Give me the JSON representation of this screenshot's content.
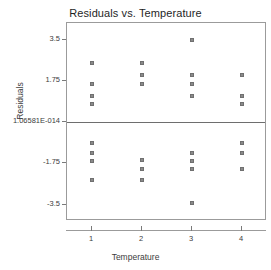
{
  "chart_data": {
    "type": "scatter",
    "title": "Residuals vs. Temperature",
    "xlabel": "Temperature",
    "ylabel": "Residuals",
    "grid": false,
    "legend": null,
    "reference_line": {
      "y": 0,
      "label": "zero-residual-line"
    },
    "xlim": [
      0.5,
      4.5
    ],
    "ylim": [
      -4.2,
      4.2
    ],
    "xticks": [
      1,
      2,
      3,
      4
    ],
    "xtick_labels": [
      "1",
      "2",
      "3",
      "4"
    ],
    "yticks": [
      3.5,
      1.75,
      0,
      -1.75,
      -3.5
    ],
    "ytick_labels": [
      "3.5",
      "1.75",
      "1.06581E-014",
      "-1.75",
      "-3.5"
    ],
    "x": [
      1,
      1,
      1,
      1,
      1,
      1,
      1,
      1,
      2,
      2,
      2,
      2,
      2,
      2,
      3,
      3,
      3,
      3,
      3,
      3,
      3,
      3,
      4,
      4,
      4,
      4,
      4,
      4
    ],
    "y": [
      2.5,
      1.6,
      1.1,
      0.75,
      -0.9,
      -1.3,
      -1.65,
      -2.45,
      2.5,
      2.0,
      1.6,
      -1.6,
      -2.0,
      -2.45,
      3.5,
      2.0,
      1.6,
      1.1,
      -1.3,
      -1.65,
      -2.0,
      -3.45,
      2.0,
      1.1,
      0.75,
      -0.9,
      -1.3,
      -2.0
    ],
    "groups": [
      {
        "category": "1",
        "values": [
          2.5,
          1.6,
          1.1,
          0.75,
          -0.9,
          -1.3,
          -1.65,
          -2.45
        ]
      },
      {
        "category": "2",
        "values": [
          2.5,
          2.0,
          1.6,
          -1.6,
          -2.0,
          -2.45
        ]
      },
      {
        "category": "3",
        "values": [
          3.5,
          2.0,
          1.6,
          1.1,
          -1.3,
          -1.65,
          -2.0,
          -3.45
        ]
      },
      {
        "category": "4",
        "values": [
          2.0,
          1.1,
          0.75,
          -0.9,
          -1.3,
          -2.0
        ]
      }
    ],
    "marker": {
      "shape": "square",
      "size": 4,
      "color": "#8a8a8a",
      "edge_color": "#707070"
    },
    "colors": {
      "frame": "#9b9b9b",
      "zero_line": "#6e6e6e",
      "text": "#3c3c3c",
      "background": "#ffffff"
    }
  }
}
